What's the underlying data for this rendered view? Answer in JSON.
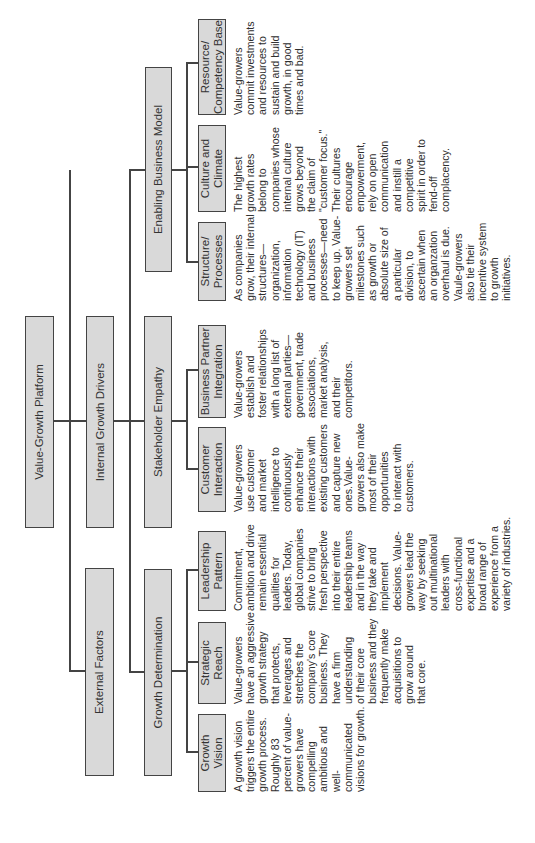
{
  "diagram": {
    "root": {
      "label": "Value-Growth Platform"
    },
    "level1": [
      {
        "id": "external",
        "label": "External Factors"
      },
      {
        "id": "internal",
        "label": "Internal Growth Drivers"
      }
    ],
    "level2": [
      {
        "id": "growth_determination",
        "label": "Growth Determination",
        "parent": "internal"
      },
      {
        "id": "stakeholder_empathy",
        "label": "Stakeholder Empathy",
        "parent": "internal"
      },
      {
        "id": "enabling_business_model",
        "label": "Enabling Business Model",
        "parent": "internal"
      }
    ],
    "level3": [
      {
        "label": "Growth\nVision",
        "parent": "growth_determination",
        "desc": "A growth vision\ntriggers the entire\ngrowth process.\nRoughly 83\npercent of value-\ngrowers have\ncompelling\nambitious and\nwell-communicated\nvisions for growth."
      },
      {
        "label": "Strategic\nReach",
        "parent": "growth_determination",
        "desc": "Value-growers\nhave an aggressive\ngrowth strategy\nthat protects,\nleverages and\nstretches the\ncompany's core\nbusiness. They\nhave a firm\nunderstanding\nof their core\nbusiness and they\nfrequently make\nacquisitions to\ngrow around\nthat core."
      },
      {
        "label": "Leadership\nPattern",
        "parent": "growth_determination",
        "desc": "Commitment,\nambition and drive\nremain essential\nqualities for\nleaders. Today,\nglobal companies\nstrive to bring\nfresh perspective\ninto their entire\nleadership teams\nand in the way\nthey take and\nimplement\ndecisions. Value-\ngrowers lead the\nway by seeking\nout multinational\nleaders with\ncross-functional\nexpertise and a\nbroad range of\nexperience from a\nvariety of industries."
      },
      {
        "label": "Customer\nInteraction",
        "parent": "stakeholder_empathy",
        "desc": "Value-growers\nuse customer\nand market\nintelligence to\ncontinuously\nenhance their\ninteractions with\nexisting customers\nand capture new\nones.Value-\ngrowers also make\nmost of their\nopportunities\nto interact with\ncustomers."
      },
      {
        "label": "Business Partner\nIntegration",
        "parent": "stakeholder_empathy",
        "desc": "Value-growers\nestablish and\nfoster relationships\nwith a long list of\nexternal parties—\ngovernment, trade\nassociations,\nmarket analysis,\nand their\ncompetitors."
      },
      {
        "label": "Structure/\nProcesses",
        "parent": "enabling_business_model",
        "desc": "As companies\ngrow, their internal\nstructures—\norganization,\ninformation\ntechnology (IT)\nand business\nprocesses—need\nto keep up. Value-\ngrowers set\nmilestones such\nas growth or\nabsolute size of\na particular\ndivision, to\nascertain when\nan organzation\noverhaul is due.\nVaule-growers\nalso tie their\nincentive system\nto growth\ninitiatives."
      },
      {
        "label": "Culture and\nClimate",
        "parent": "enabling_business_model",
        "desc": "The highest\ngrowth rates\nbelong to\ncompanies whose\ninternal culture\ngrows beyond\nthe claim of\n\"customer focus.\"\nTheir cultures\nencourage\nempowerment,\nrely on open\ncommunication\nand instill a\ncompetitive\nspirit in order to\nfend-off\ncomplacency."
      },
      {
        "label": "Resource/\nCompetency Base",
        "parent": "enabling_business_model",
        "desc": "Value-growers\ncommit investments\nand resources to\nsustain and build\ngrowth, in good\ntimes and bad."
      }
    ]
  },
  "colors": {
    "box_fill": "#d9d9d9",
    "box_border": "#444444",
    "line": "#444444",
    "text": "#2e2e2e"
  }
}
